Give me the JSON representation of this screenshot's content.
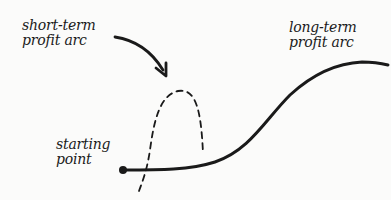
{
  "diagram": {
    "labels": {
      "short_term": [
        "short-term",
        "profit arc"
      ],
      "long_term": [
        "long-term",
        "profit arc"
      ],
      "start": [
        "starting",
        "point"
      ]
    },
    "colors": {
      "ink": "#1a1a1a",
      "background": "#fbfbfa"
    },
    "elements": [
      {
        "id": "long-term-curve",
        "style": "solid",
        "description": "S-curve rising from starting point to upper right"
      },
      {
        "id": "short-term-arc",
        "style": "dashed",
        "description": "steep arc that rises quickly and falls back"
      },
      {
        "id": "start-dot",
        "style": "filled-circle"
      },
      {
        "id": "pointer-arrow",
        "style": "curved-arrow",
        "points_to": "short-term-arc"
      }
    ]
  }
}
